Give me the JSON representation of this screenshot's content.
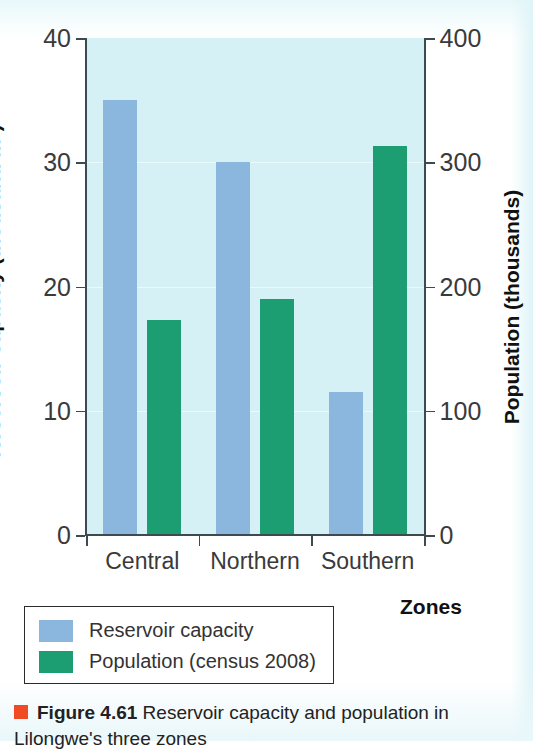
{
  "figure": {
    "caption_marker": "orange-square-marker",
    "figure_number": "Figure 4.61",
    "caption_text": "Reservoir capacity and population in Lilongwe's three zones"
  },
  "chart_data": {
    "type": "bar",
    "title": "",
    "subtitle": "",
    "xlabel": "Zones",
    "ylabel": "Reservoir capacity (thousand m3)",
    "ylabel_secondary": "Population (thousands)",
    "categories": [
      "Central",
      "Northern",
      "Southern"
    ],
    "series": [
      {
        "name": "Reservoir capacity",
        "axis": "left",
        "unit": "thousand m3",
        "color": "#8bb6dd",
        "values": [
          35,
          30,
          11.5
        ]
      },
      {
        "name": "Population (census 2008)",
        "axis": "right",
        "unit": "thousands",
        "color": "#1d9d72",
        "values": [
          173,
          190,
          313
        ]
      }
    ],
    "ylim": [
      0,
      40
    ],
    "ylim_secondary": [
      0,
      400
    ],
    "yticks": [
      0,
      10,
      20,
      30,
      40
    ],
    "yticks_secondary": [
      0,
      100,
      200,
      300,
      400
    ],
    "grid": true,
    "legend_position": "below-left",
    "plot_background": "#d5f1f5"
  },
  "axes": {
    "left": {
      "title_main": "Reservoir capacity (thousand m",
      "title_sup": "3",
      "title_close": ")",
      "tick_labels": [
        "0",
        "10",
        "20",
        "30",
        "40"
      ]
    },
    "right": {
      "title": "Population (thousands)",
      "tick_labels": [
        "0",
        "100",
        "200",
        "300",
        "400"
      ]
    },
    "bottom": {
      "title": "Zones",
      "tick_labels": [
        "Central",
        "Northern",
        "Southern"
      ]
    }
  },
  "legend": {
    "items": [
      {
        "label": "Reservoir capacity",
        "color": "#8bb6dd"
      },
      {
        "label": "Population (census 2008)",
        "color": "#1d9d72"
      }
    ]
  }
}
